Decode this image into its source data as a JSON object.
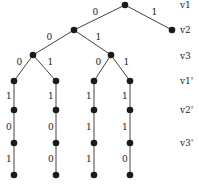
{
  "diagram": {
    "type": "binary-tree",
    "level_labels": [
      "v1",
      "v2",
      "v3",
      "v1'",
      "v2'",
      "v3'"
    ],
    "nodes": {
      "root": [
        125,
        5
      ],
      "r1": [
        172,
        30
      ],
      "l1": [
        74,
        30
      ],
      "ll": [
        33,
        55
      ],
      "lr": [
        111,
        55
      ],
      "a1": [
        14,
        81
      ],
      "b1": [
        56,
        81
      ],
      "c1": [
        94,
        81
      ],
      "d1": [
        130,
        81
      ],
      "a2": [
        14,
        110
      ],
      "b2": [
        56,
        110
      ],
      "c2": [
        94,
        110
      ],
      "d2": [
        130,
        110
      ],
      "a3": [
        14,
        143
      ],
      "b3": [
        56,
        143
      ],
      "c3": [
        94,
        143
      ],
      "d3": [
        130,
        143
      ],
      "a4": [
        14,
        175
      ],
      "b4": [
        56,
        175
      ],
      "c4": [
        94,
        175
      ],
      "d4": [
        130,
        175
      ]
    },
    "edges": [
      {
        "from": "root",
        "to": "l1",
        "label": "0"
      },
      {
        "from": "root",
        "to": "r1",
        "label": "1"
      },
      {
        "from": "l1",
        "to": "ll",
        "label": "0"
      },
      {
        "from": "l1",
        "to": "lr",
        "label": "1"
      },
      {
        "from": "ll",
        "to": "a1",
        "label": "0"
      },
      {
        "from": "ll",
        "to": "b1",
        "label": "1"
      },
      {
        "from": "lr",
        "to": "c1",
        "label": "0"
      },
      {
        "from": "lr",
        "to": "d1",
        "label": "1"
      },
      {
        "from": "a1",
        "to": "a2",
        "label": "1"
      },
      {
        "from": "b1",
        "to": "b2",
        "label": "1"
      },
      {
        "from": "c1",
        "to": "c2",
        "label": "1"
      },
      {
        "from": "d1",
        "to": "d2",
        "label": "1"
      },
      {
        "from": "a2",
        "to": "a3",
        "label": "0"
      },
      {
        "from": "b2",
        "to": "b3",
        "label": "0"
      },
      {
        "from": "c2",
        "to": "c3",
        "label": "1"
      },
      {
        "from": "d2",
        "to": "d3",
        "label": "1"
      },
      {
        "from": "a3",
        "to": "a4",
        "label": "1"
      },
      {
        "from": "b3",
        "to": "b4",
        "label": "0"
      },
      {
        "from": "c3",
        "to": "c4",
        "label": "1"
      },
      {
        "from": "d3",
        "to": "d4",
        "label": "0"
      }
    ]
  }
}
